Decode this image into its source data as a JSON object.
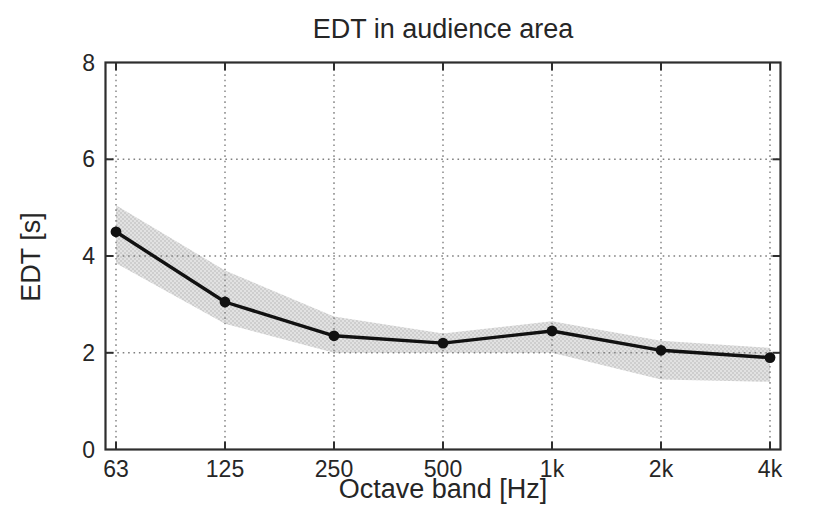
{
  "chart_data": {
    "type": "line",
    "title": "EDT in audience area",
    "xlabel": "Octave band [Hz]",
    "ylabel": "EDT [s]",
    "categories": [
      "63",
      "125",
      "250",
      "500",
      "1k",
      "2k",
      "4k"
    ],
    "series": [
      {
        "name": "EDT mean",
        "values": [
          4.5,
          3.05,
          2.35,
          2.2,
          2.45,
          2.05,
          1.9
        ],
        "marker": "filled-circle",
        "color": "#111111"
      }
    ],
    "band": {
      "name": "EDT spread across audience area",
      "lower": [
        3.85,
        2.6,
        2.0,
        2.0,
        2.0,
        1.45,
        1.4
      ],
      "upper": [
        5.05,
        3.7,
        2.75,
        2.4,
        2.65,
        2.25,
        2.1
      ],
      "color": "#d9d9d9"
    },
    "yticks": [
      0,
      2,
      4,
      6,
      8
    ],
    "ylim": [
      0,
      8
    ],
    "grid": "dotted",
    "legend": "none"
  },
  "style": {
    "background": "#ffffff",
    "text_color": "#262626",
    "axis_color": "#2e2e2e",
    "grid_color": "#808080",
    "line_color": "#111111",
    "marker_color": "#111111",
    "band_base_color": "#e2e2e2",
    "band_dot_color": "#c8c8c8"
  }
}
